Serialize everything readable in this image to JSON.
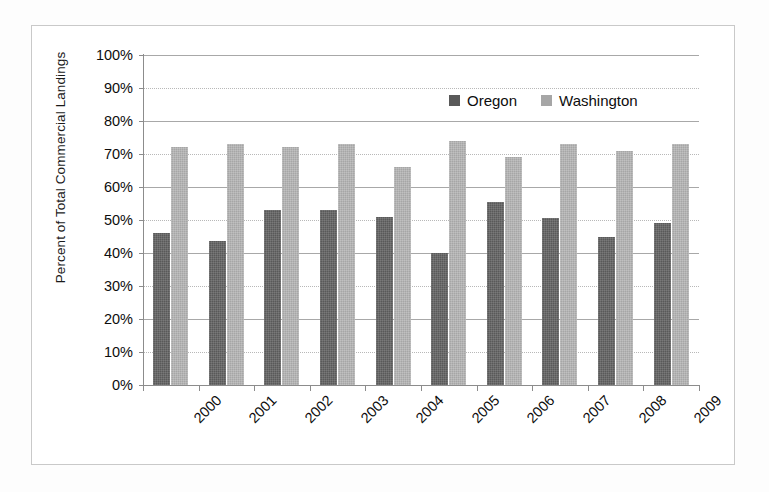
{
  "chart_data": {
    "type": "bar",
    "title": "",
    "subtitle": "",
    "xlabel": "",
    "ylabel": "Percent of Total Commercial Landings",
    "categories": [
      "2000",
      "2001",
      "2002",
      "2003",
      "2004",
      "2005",
      "2006",
      "2007",
      "2008",
      "2009"
    ],
    "series": [
      {
        "name": "Oregon",
        "color": "#595959",
        "values": [
          46,
          43.5,
          53,
          53,
          51,
          40,
          55.5,
          50.5,
          45,
          49
        ]
      },
      {
        "name": "Washington",
        "color": "#a6a6a6",
        "values": [
          72,
          73,
          72,
          73,
          66,
          74,
          69,
          73,
          71,
          73
        ]
      }
    ],
    "ylim": [
      0,
      100
    ],
    "ytick_values": [
      0,
      10,
      20,
      30,
      40,
      50,
      60,
      70,
      80,
      90,
      100
    ],
    "ytick_labels": [
      "0%",
      "10%",
      "20%",
      "30%",
      "40%",
      "50%",
      "60%",
      "70%",
      "80%",
      "90%",
      "100%"
    ],
    "grid": true,
    "grid_axis": "y",
    "legend_position": "top-right-inside",
    "xtick_rotation": -45
  },
  "legend": {
    "entries": [
      {
        "label": "Oregon",
        "swatch": "oregon-swatch-icon"
      },
      {
        "label": "Washington",
        "swatch": "washington-swatch-icon"
      }
    ]
  },
  "axes": {
    "y_title": "Percent of Total Commercial Landings"
  }
}
